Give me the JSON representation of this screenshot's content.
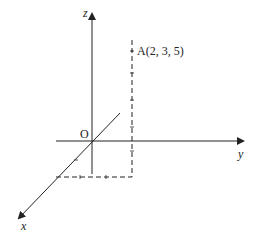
{
  "diagram": {
    "type": "3d-coordinate-axes",
    "axes": {
      "x_label": "x",
      "y_label": "y",
      "z_label": "z"
    },
    "origin_label": "O",
    "point": {
      "label": "A(2, 3, 5)",
      "coordinates": [
        2,
        3,
        5
      ]
    },
    "colors": {
      "line": "#222222",
      "background": "#ffffff"
    }
  }
}
